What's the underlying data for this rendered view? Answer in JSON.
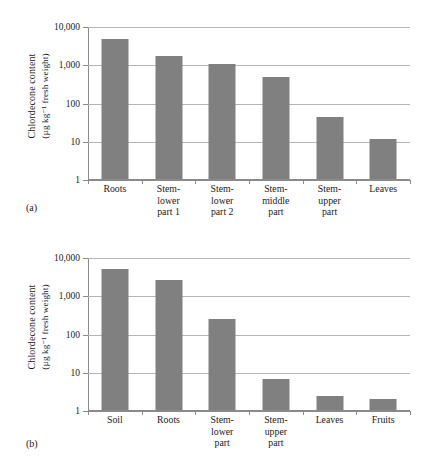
{
  "figure": {
    "background": "#ffffff",
    "bar_color": "#808080",
    "gridline_color": "#b4b4b4",
    "axis_color": "#8a8a8a"
  },
  "panels": [
    {
      "tag": "(a)",
      "axis_title_line1": "Chlordecone content",
      "axis_title_line2": "(µg kg⁻¹ fresh weight)"
    },
    {
      "tag": "(b)",
      "axis_title_line1": "Chlordecone content",
      "axis_title_line2": "(µg kg⁻¹ fresh weight)"
    }
  ],
  "yticks": [
    "10,000",
    "1,000",
    "100",
    "10",
    "1"
  ],
  "chart_data": [
    {
      "type": "bar",
      "panel": "(a)",
      "title": "",
      "xlabel": "",
      "ylabel": "Chlordecone content (µg kg⁻¹ fresh weight)",
      "yscale": "log",
      "ylim": [
        1,
        10000
      ],
      "ytick_values": [
        1,
        10,
        100,
        1000,
        10000
      ],
      "ytick_labels": [
        "1",
        "10",
        "100",
        "1,000",
        "10,000"
      ],
      "grid": true,
      "legend": "none",
      "categories": [
        "Roots",
        "Stem-lower part 1",
        "Stem-lower part 2",
        "Stem-middle part",
        "Stem-upper part",
        "Leaves"
      ],
      "category_labels_wrapped": [
        "Roots",
        "Stem-\nlower\npart 1",
        "Stem-\nlower\npart 2",
        "Stem-\nmiddle\npart",
        "Stem-\nupper\npart",
        "Leaves"
      ],
      "values": [
        5000,
        1800,
        1050,
        500,
        45,
        12
      ]
    },
    {
      "type": "bar",
      "panel": "(b)",
      "title": "",
      "xlabel": "",
      "ylabel": "Chlordecone content (µg kg⁻¹ fresh weight)",
      "yscale": "log",
      "ylim": [
        1,
        10000
      ],
      "ytick_values": [
        1,
        10,
        100,
        1000,
        10000
      ],
      "ytick_labels": [
        "1",
        "10",
        "100",
        "1,000",
        "10,000"
      ],
      "grid": true,
      "legend": "none",
      "categories": [
        "Soil",
        "Roots",
        "Stem-lower part",
        "Stem-upper part",
        "Leaves",
        "Fruits"
      ],
      "category_labels_wrapped": [
        "Soil",
        "Roots",
        "Stem-\nlower\npart",
        "Stem-\nupper\npart",
        "Leaves",
        "Fruits"
      ],
      "values": [
        5200,
        2700,
        260,
        7,
        2.4,
        2.1
      ]
    }
  ]
}
